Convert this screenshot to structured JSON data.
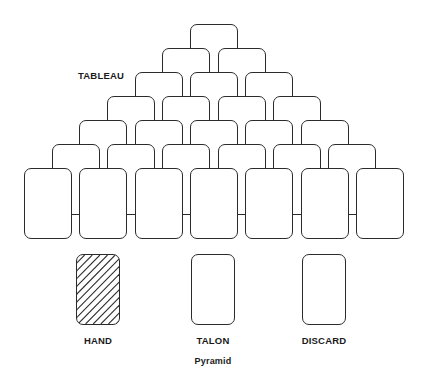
{
  "diagram": {
    "caption": "Pyramid",
    "tableau_label": "TABLEAU",
    "piles": [
      {
        "name": "hand",
        "label": "HAND",
        "fill": "hatched"
      },
      {
        "name": "talon",
        "label": "TALON",
        "fill": "empty"
      },
      {
        "name": "discard",
        "label": "DISCARD",
        "fill": "empty"
      }
    ],
    "colors": {
      "card_stroke": "#2b2b2b",
      "card_fill": "#ffffff",
      "text": "#1a1a1a",
      "background": "#ffffff"
    },
    "tableau": {
      "rows": 7,
      "cards_per_row": [
        1,
        2,
        3,
        4,
        5,
        6,
        7
      ],
      "total_cards": 28,
      "card_width": 48,
      "card_height": 71,
      "row_pitch": 24,
      "column_pitch": 55.3,
      "apex_x": 190,
      "apex_y": 24
    }
  }
}
